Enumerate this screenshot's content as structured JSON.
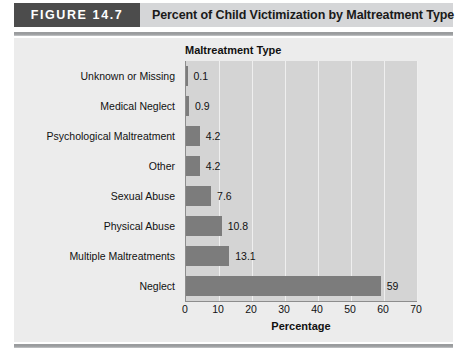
{
  "header": {
    "badge_label": "FIGURE 14.7",
    "title": "Percent of Child Victimization by Maltreatment Type",
    "badge_color": "#4c4c4c",
    "header_band_color": "#d5d6d8"
  },
  "chart_data": {
    "type": "bar",
    "orientation": "horizontal",
    "title": "Maltreatment Type",
    "xlabel": "Percentage",
    "ylabel": "",
    "categories": [
      "Unknown or Missing",
      "Medical Neglect",
      "Psychological Maltreatment",
      "Other",
      "Sexual Abuse",
      "Physical Abuse",
      "Multiple Maltreatments",
      "Neglect"
    ],
    "values": [
      0.1,
      0.9,
      4.2,
      4.2,
      7.6,
      10.8,
      13.1,
      59
    ],
    "value_labels": [
      "0.1",
      "0.9",
      "4.2",
      "4.2",
      "7.6",
      "10.8",
      "13.1",
      "59"
    ],
    "xlim": [
      0,
      70
    ],
    "xticks": [
      0,
      10,
      20,
      30,
      40,
      50,
      60,
      70
    ],
    "xtick_labels": [
      "0",
      "10",
      "20",
      "30",
      "40",
      "50",
      "60",
      "70"
    ],
    "grid": true,
    "legend": false,
    "bar_color": "#7c7c7c",
    "plot_background": "#d4d4d4",
    "panel_background": "#ececec"
  }
}
